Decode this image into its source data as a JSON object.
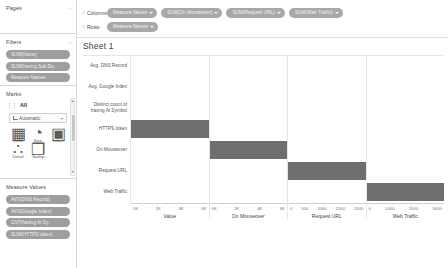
{
  "left_panel": {
    "pages": {
      "title": "Pages",
      "caret": "›"
    },
    "filters": {
      "title": "Filters",
      "caret": "›",
      "pills": [
        {
          "label": "SUM(Name)"
        },
        {
          "label": "SUM(having Sub Do.."
        },
        {
          "label": "Measure Names"
        }
      ]
    },
    "marks": {
      "title": "Marks",
      "grip": "⋮⋮",
      "all_label": "All",
      "mark_type": "Automatic",
      "mark_type_caret": "▾",
      "buttons": [
        {
          "name": "color",
          "label": "Color",
          "glyph": "▦"
        },
        {
          "name": "size",
          "label": "Size",
          "glyph": "◔"
        },
        {
          "name": "label",
          "label": "Label",
          "glyph": "▣"
        },
        {
          "name": "detail",
          "label": "Detail",
          "glyph": "∴"
        },
        {
          "name": "tooltip",
          "label": "Tooltip",
          "glyph": "❐"
        }
      ]
    },
    "measure_values": {
      "title": "Measure Values",
      "pills": [
        {
          "label": "AVG(DNS Record)"
        },
        {
          "label": "AVG(Google Index)"
        },
        {
          "label": "CNT(having At Sy.."
        },
        {
          "label": "SUM(HTTPS token)"
        }
      ]
    },
    "scrollbar": {
      "up": "▲",
      "down": "▼"
    }
  },
  "shelves": {
    "columns": {
      "label": "Columns",
      "grip": "∷",
      "pills": [
        {
          "label": "Measure Values",
          "caret": true
        },
        {
          "label": "SUM(On Mouseover)",
          "caret": true
        },
        {
          "label": "SUM(Request URL)",
          "caret": true
        },
        {
          "label": "SUM(Web Traffic)",
          "caret": true
        }
      ]
    },
    "rows": {
      "label": "Rows",
      "grip": "∷",
      "pills": [
        {
          "label": "Measure Names",
          "caret": true
        }
      ]
    }
  },
  "sheet": {
    "title": "Sheet 1"
  },
  "chart_data": {
    "type": "bar",
    "title": "Sheet 1",
    "grid": false,
    "legend": null,
    "row_headers": [
      "Avg. DNS Record",
      "Avg. Google Index",
      "Distinct count of having At Symbol",
      "HTTPS token",
      "On Mouseover",
      "Request URL",
      "Web Traffic"
    ],
    "categories": [
      "HTTPS token",
      "On Mouseover",
      "Request URL",
      "Web Traffic"
    ],
    "panels": [
      {
        "name": "Value",
        "xlabel": "Value",
        "ticks": [
          "0K",
          "2K",
          "4K",
          "6K"
        ],
        "xlim": [
          0,
          6000
        ],
        "bar_category": "HTTPS token",
        "bar_value": 6000
      },
      {
        "name": "On Mouseover",
        "xlabel": "On Mouseover",
        "ticks": [
          "0K",
          "2K",
          "4K",
          "6K"
        ],
        "xlim": [
          0,
          6000
        ],
        "bar_category": "On Mouseover",
        "bar_value": 6000
      },
      {
        "name": "Request URL",
        "xlabel": "Request URL",
        "ticks": [
          "0",
          "500",
          "1000",
          "1500",
          "2000"
        ],
        "xlim": [
          0,
          2000
        ],
        "bar_category": "Request URL",
        "bar_value": 2000
      },
      {
        "name": "Web Traffic",
        "xlabel": "Web Traffic",
        "ticks": [
          "0",
          "1000",
          "2000",
          "3000"
        ],
        "xlim": [
          0,
          3000
        ],
        "bar_category": "Web Traffic",
        "bar_value": 3000
      }
    ],
    "bar_color": "#6e6e6e"
  }
}
